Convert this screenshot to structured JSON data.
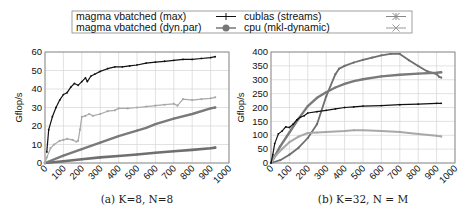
{
  "legend": {
    "items": [
      {
        "label": "magma vbatched (max)",
        "marker": "plus",
        "color": "#111111"
      },
      {
        "label": "magma vbatched (dyn.par)",
        "marker": "circle",
        "color": "#777777"
      },
      {
        "label": "cublas (streams)",
        "marker": "star",
        "color": "#888888"
      },
      {
        "label": "cpu (mkl-dynamic)",
        "marker": "cross",
        "color": "#9a9a9a"
      }
    ]
  },
  "chart_data": [
    {
      "type": "line",
      "title": "",
      "caption": "(a) K=8, N=8",
      "xlabel": "",
      "ylabel": "Gflop/s",
      "xlim": [
        0,
        1000
      ],
      "ylim": [
        0,
        60
      ],
      "xticks": [
        "0",
        "100",
        "200",
        "300",
        "400",
        "500",
        "600",
        "700",
        "800",
        "900",
        "1000"
      ],
      "yticks": [
        "0",
        "10",
        "20",
        "30",
        "40",
        "50",
        "60"
      ],
      "grid": true,
      "series": [
        {
          "name": "magma vbatched (max)",
          "color": "#111111",
          "width": 1.2,
          "x": [
            10,
            20,
            40,
            60,
            80,
            100,
            120,
            140,
            160,
            180,
            200,
            220,
            230,
            250,
            270,
            300,
            340,
            380,
            420,
            460,
            500,
            550,
            600,
            650,
            700,
            750,
            800,
            850,
            900,
            925
          ],
          "y": [
            6,
            18,
            25,
            30,
            34,
            37,
            38,
            41,
            43,
            42,
            44,
            46,
            44,
            47,
            48,
            49.5,
            51,
            52,
            52,
            52.5,
            53,
            54,
            54.5,
            55,
            55.5,
            56,
            56,
            56.5,
            57,
            57.5
          ]
        },
        {
          "name": "magma vbatched (dyn.par)",
          "color": "#7a7a7a",
          "width": 2.4,
          "x": [
            0,
            100,
            200,
            300,
            400,
            500,
            550,
            600,
            700,
            800,
            900,
            925
          ],
          "y": [
            0,
            4,
            7.5,
            11,
            14.5,
            17.5,
            19,
            21,
            24,
            26.5,
            29.5,
            30
          ]
        },
        {
          "name": "cublas (streams)",
          "color": "#6f6f6f",
          "width": 2.6,
          "x": [
            0,
            100,
            200,
            300,
            400,
            500,
            600,
            700,
            800,
            900,
            925
          ],
          "y": [
            0,
            1,
            2,
            3,
            3.8,
            4.6,
            5.5,
            6.3,
            7.1,
            8,
            8.3
          ]
        },
        {
          "name": "cpu (mkl-dynamic)",
          "color": "#a8a8a8",
          "width": 1.2,
          "x": [
            0,
            10,
            30,
            50,
            80,
            100,
            120,
            150,
            170,
            180,
            190,
            200,
            220,
            240,
            260,
            300,
            340,
            380,
            400,
            450,
            500,
            550,
            600,
            650,
            700,
            720,
            750,
            800,
            850,
            900,
            925
          ],
          "y": [
            0,
            3,
            8,
            10,
            12,
            12.5,
            13,
            12.5,
            11.5,
            12,
            18,
            25,
            25.5,
            26.5,
            25.5,
            26.5,
            28,
            28.5,
            29.5,
            29.5,
            30,
            30.5,
            31,
            31.5,
            32,
            31,
            34.5,
            34,
            34.5,
            35,
            35.5
          ]
        }
      ]
    },
    {
      "type": "line",
      "title": "",
      "caption": "(b) K=32, N = M",
      "xlabel": "",
      "ylabel": "Gflop/s",
      "xlim": [
        0,
        1000
      ],
      "ylim": [
        0,
        400
      ],
      "xticks": [
        "0",
        "100",
        "200",
        "300",
        "400",
        "500",
        "600",
        "700",
        "800",
        "900",
        "1000"
      ],
      "yticks": [
        "0",
        "50",
        "100",
        "150",
        "200",
        "250",
        "300",
        "350",
        "400"
      ],
      "grid": true,
      "series": [
        {
          "name": "magma vbatched (max)",
          "color": "#111111",
          "width": 1.2,
          "x": [
            0,
            10,
            20,
            40,
            60,
            80,
            100,
            120,
            140,
            160,
            180,
            200,
            250,
            300,
            350,
            400,
            450,
            500,
            600,
            700,
            800,
            900,
            925
          ],
          "y": [
            0,
            30,
            70,
            105,
            115,
            130,
            128,
            140,
            155,
            165,
            170,
            180,
            185,
            190,
            195,
            200,
            202,
            205,
            207,
            210,
            212,
            215,
            215
          ]
        },
        {
          "name": "magma vbatched (dyn.par)",
          "color": "#7a7a7a",
          "width": 2.4,
          "x": [
            0,
            50,
            100,
            150,
            200,
            250,
            300,
            350,
            400,
            450,
            500,
            600,
            700,
            800,
            900,
            925
          ],
          "y": [
            0,
            60,
            110,
            160,
            205,
            235,
            255,
            272,
            285,
            295,
            302,
            312,
            318,
            322,
            325,
            327
          ]
        },
        {
          "name": "cublas (streams)",
          "color": "#6f6f6f",
          "width": 1.8,
          "x": [
            0,
            50,
            100,
            150,
            200,
            250,
            300,
            350,
            370,
            400,
            450,
            500,
            550,
            600,
            650,
            700,
            750,
            800,
            850,
            900,
            915,
            925
          ],
          "y": [
            0,
            10,
            30,
            55,
            90,
            140,
            240,
            320,
            340,
            350,
            362,
            372,
            380,
            388,
            393,
            393,
            370,
            350,
            330,
            320,
            310,
            308
          ]
        },
        {
          "name": "cpu (mkl-dynamic)",
          "color": "#a8a8a8",
          "width": 2.0,
          "x": [
            0,
            30,
            60,
            100,
            150,
            200,
            250,
            300,
            400,
            450,
            500,
            600,
            700,
            800,
            900,
            925
          ],
          "y": [
            0,
            30,
            50,
            75,
            95,
            108,
            110,
            112,
            115,
            118,
            118,
            115,
            112,
            105,
            98,
            96
          ]
        }
      ]
    }
  ]
}
